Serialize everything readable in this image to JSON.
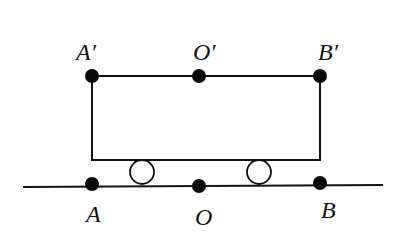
{
  "diagram": {
    "colors": {
      "stroke": "#111111",
      "dot": "#0a0a0a",
      "wheel_fill": "#ffffff",
      "background": "#ffffff"
    },
    "top_points": [
      {
        "label": "A′",
        "x": 92,
        "y": 76
      },
      {
        "label": "O′",
        "x": 199,
        "y": 76
      },
      {
        "label": "B′",
        "x": 320,
        "y": 76
      }
    ],
    "bottom_points": [
      {
        "label": "A",
        "x": 92,
        "y": 184
      },
      {
        "label": "O",
        "x": 199,
        "y": 186
      },
      {
        "label": "B",
        "x": 320,
        "y": 183
      }
    ],
    "cart": {
      "x": 92,
      "y": 76,
      "width": 228,
      "height": 84
    },
    "wheels": [
      {
        "cx": 142,
        "cy": 172,
        "r": 12
      },
      {
        "cx": 259,
        "cy": 172,
        "r": 12
      }
    ],
    "ground": {
      "x1": 23,
      "y1": 187,
      "x2": 383,
      "y2": 185
    }
  }
}
